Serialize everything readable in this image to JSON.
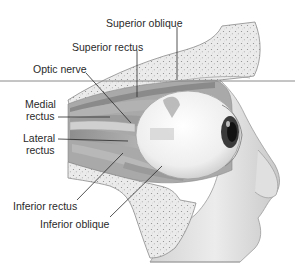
{
  "diagram": {
    "colors": {
      "background": "#ffffff",
      "bone": "#e9e9e9",
      "bone_speckle": "#9a9a9a",
      "tissue_dark": "#8c8c8c",
      "tissue_mid": "#bdbdbd",
      "tissue_light": "#d8d8d8",
      "eyeball": "#f4f4f4",
      "iris": "#222222",
      "leader_line": "#2a2a2a",
      "plane_line": "#8a8a8a"
    },
    "labels": [
      {
        "id": "superior-oblique",
        "text": "Superior oblique",
        "x": 106,
        "y": 17,
        "anchor": [
          177,
          80
        ]
      },
      {
        "id": "superior-rectus",
        "text": "Superior rectus",
        "x": 72,
        "y": 41,
        "anchor": [
          137,
          97
        ]
      },
      {
        "id": "optic-nerve",
        "text": "Optic nerve",
        "x": 33,
        "y": 63,
        "anchor": [
          131,
          123
        ]
      },
      {
        "id": "medial-rectus-line1",
        "text": "Medial",
        "x": 25,
        "y": 98
      },
      {
        "id": "medial-rectus-line2",
        "text": "rectus",
        "x": 26,
        "y": 110,
        "anchor": [
          110,
          117
        ]
      },
      {
        "id": "lateral-rectus-line1",
        "text": "Lateral",
        "x": 23,
        "y": 132
      },
      {
        "id": "lateral-rectus-line2",
        "text": "rectus",
        "x": 26,
        "y": 144,
        "anchor": [
          128,
          141
        ]
      },
      {
        "id": "inferior-rectus",
        "text": "Inferior rectus",
        "x": 13,
        "y": 200,
        "anchor": [
          123,
          153
        ]
      },
      {
        "id": "inferior-oblique",
        "text": "Inferior oblique",
        "x": 40,
        "y": 218,
        "anchor": [
          162,
          166
        ]
      }
    ]
  }
}
